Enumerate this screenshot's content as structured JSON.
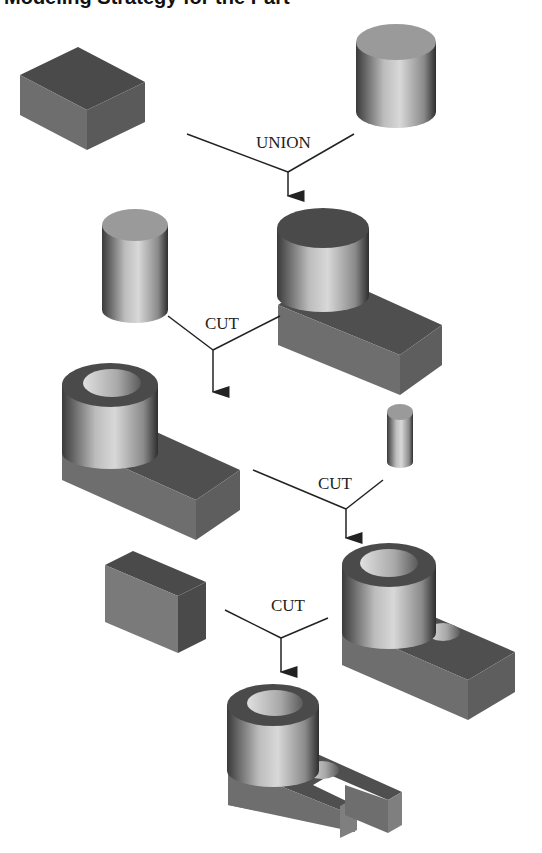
{
  "title": "Modeling Strategy for the Part",
  "operations": [
    {
      "id": "op1",
      "label": "UNION",
      "inputs": [
        "rectangular block",
        "cylinder"
      ],
      "output": "block with cylinder boss"
    },
    {
      "id": "op2",
      "label": "CUT",
      "inputs": [
        "cylinder",
        "block with cylinder boss"
      ],
      "output": "boss with bore"
    },
    {
      "id": "op3",
      "label": "CUT",
      "inputs": [
        "boss with bore",
        "small cylinder"
      ],
      "output": "part with hole"
    },
    {
      "id": "op4",
      "label": "CUT",
      "inputs": [
        "rectangular block",
        "part with hole"
      ],
      "output": "part with slot"
    }
  ],
  "colors": {
    "top_dark": "#4a4a4a",
    "side_mid": "#6e6e6e",
    "side_light": "#858585",
    "cyl_top": "#9a9a9a",
    "line": "#222222"
  }
}
